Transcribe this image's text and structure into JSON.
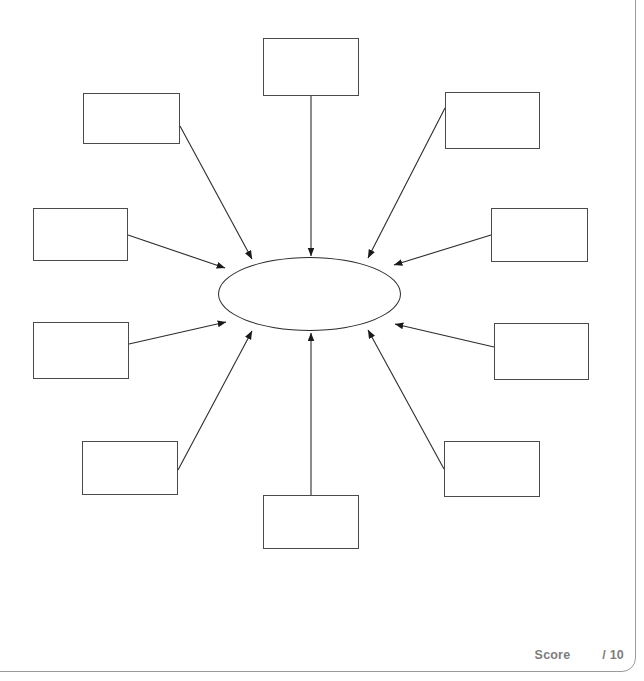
{
  "page": {
    "type": "worksheet-diagram",
    "background_color": "#ffffff",
    "frame_color": "#9a9a9a"
  },
  "diagram": {
    "kind": "radial-concept-map",
    "line_color": "#2c2c2c",
    "box_border_color": "#4a4a4a",
    "center": {
      "name": "center-oval",
      "label": "",
      "cx": 309.5,
      "cy": 293.5,
      "rx": 91.5,
      "ry": 37
    },
    "nodes": [
      {
        "id": "node-top",
        "label": "",
        "x": 263,
        "y": 38,
        "w": 96,
        "h": 58,
        "arrow_from": [
          311,
          96
        ],
        "arrow_to": [
          311,
          256
        ]
      },
      {
        "id": "node-top-left",
        "label": "",
        "x": 83,
        "y": 93,
        "w": 97,
        "h": 51,
        "arrow_from": [
          180,
          126
        ],
        "arrow_to": [
          252,
          259
        ]
      },
      {
        "id": "node-top-right",
        "label": "",
        "x": 445,
        "y": 92,
        "w": 95,
        "h": 57,
        "arrow_from": [
          445,
          108
        ],
        "arrow_to": [
          368,
          258
        ]
      },
      {
        "id": "node-upper-left",
        "label": "",
        "x": 33,
        "y": 208,
        "w": 95,
        "h": 53,
        "arrow_from": [
          128,
          235
        ],
        "arrow_to": [
          225,
          268
        ]
      },
      {
        "id": "node-upper-right",
        "label": "",
        "x": 491,
        "y": 208,
        "w": 97,
        "h": 54,
        "arrow_from": [
          491,
          235
        ],
        "arrow_to": [
          394,
          265
        ]
      },
      {
        "id": "node-lower-left",
        "label": "",
        "x": 33,
        "y": 322,
        "w": 96,
        "h": 57,
        "arrow_from": [
          129,
          344
        ],
        "arrow_to": [
          226,
          322
        ]
      },
      {
        "id": "node-lower-right",
        "label": "",
        "x": 494,
        "y": 323,
        "w": 95,
        "h": 57,
        "arrow_from": [
          494,
          347
        ],
        "arrow_to": [
          395,
          324
        ]
      },
      {
        "id": "node-bottom-left",
        "label": "",
        "x": 82,
        "y": 441,
        "w": 96,
        "h": 54,
        "arrow_from": [
          178,
          470
        ],
        "arrow_to": [
          252,
          331
        ]
      },
      {
        "id": "node-bottom-right",
        "label": "",
        "x": 444,
        "y": 441,
        "w": 96,
        "h": 56,
        "arrow_from": [
          444,
          469
        ],
        "arrow_to": [
          368,
          330
        ]
      },
      {
        "id": "node-bottom",
        "label": "",
        "x": 263,
        "y": 495,
        "w": 96,
        "h": 54,
        "arrow_from": [
          311,
          495
        ],
        "arrow_to": [
          311,
          333
        ]
      }
    ]
  },
  "footer": {
    "score_label": "Score",
    "score_value": "",
    "score_total": "/ 10",
    "text_color": "#7d7d7d"
  }
}
